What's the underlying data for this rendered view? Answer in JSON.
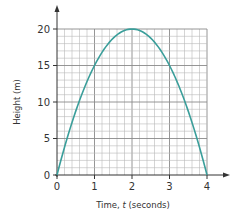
{
  "chart_data": {
    "type": "line",
    "title": "",
    "xlabel": "Time, t (seconds)",
    "xlabel_parts": {
      "pre": "Time, ",
      "var": "t",
      "post": " (seconds)"
    },
    "ylabel": "Height (m)",
    "xlim": [
      0,
      4
    ],
    "ylim": [
      0,
      20
    ],
    "x_ticks": [
      0,
      1,
      2,
      3,
      4
    ],
    "y_ticks": [
      0,
      5,
      10,
      15,
      20
    ],
    "x_minor_step": 0.2,
    "y_minor_step": 1,
    "grid": true,
    "legend": null,
    "series": [
      {
        "name": "height",
        "color": "#3a9e9a",
        "equation": "h = 5t(4 - t)",
        "x": [
          0,
          0.5,
          1,
          1.5,
          2,
          2.5,
          3,
          3.5,
          4
        ],
        "values": [
          0,
          8.75,
          15,
          18.75,
          20,
          18.75,
          15,
          8.75,
          0
        ]
      }
    ]
  },
  "colors": {
    "curve": "#3a9e9a",
    "grid": "#b8b8b8",
    "axis": "#333333"
  }
}
